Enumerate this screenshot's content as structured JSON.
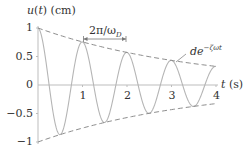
{
  "chart_data": {
    "type": "line",
    "title": "",
    "xlabel": "t (s)",
    "ylabel": "u(t) (cm)",
    "xlim": [
      0,
      4
    ],
    "ylim": [
      -1,
      1
    ],
    "x_ticks": [
      "1",
      "2",
      "3",
      "4"
    ],
    "y_ticks": [
      "1",
      "0.5",
      "0",
      "−0.5",
      "−1"
    ],
    "grid": false,
    "legend": null,
    "series": [
      {
        "name": "u(t) damped free vibration",
        "style": "solid",
        "description": "cosine-like damped oscillation starting at 1 with period ~1 s",
        "x": [
          0,
          0.5,
          1.0,
          1.5,
          2.0,
          2.5,
          3.0,
          3.5,
          4.0
        ],
        "values": [
          1.0,
          -0.87,
          0.76,
          -0.66,
          0.57,
          -0.5,
          0.43,
          -0.37,
          0.33
        ]
      },
      {
        "name": "upper envelope",
        "style": "dashed",
        "x": [
          0,
          1,
          2,
          3,
          4
        ],
        "values": [
          1.0,
          0.76,
          0.57,
          0.43,
          0.33
        ]
      },
      {
        "name": "lower envelope",
        "style": "dashed",
        "x": [
          0,
          1,
          2,
          3,
          4
        ],
        "values": [
          -1.0,
          -0.76,
          -0.57,
          -0.43,
          -0.33
        ]
      }
    ],
    "annotations": [
      {
        "text": "2π/ωD",
        "type": "double-arrow",
        "from_x": 1.0,
        "to_x": 2.0,
        "description": "damped period"
      },
      {
        "text": "de^−ζωt",
        "type": "label",
        "points_to": "upper envelope"
      }
    ],
    "parameters": {
      "period_s": 1.0,
      "decay_rate": 0.28
    }
  },
  "labels": {
    "ylabel_main": "u(t) (cm)",
    "xlabel_main": "t (s)",
    "period_label_main": "2π/ω",
    "period_label_sub": "D",
    "envelope_label_main": "de",
    "envelope_label_sup": "−ζωt"
  },
  "colors": {
    "curve": "#b5b5b5",
    "envelope": "#8c8c8c",
    "axis": "#bdbdbd",
    "text": "#333333"
  }
}
